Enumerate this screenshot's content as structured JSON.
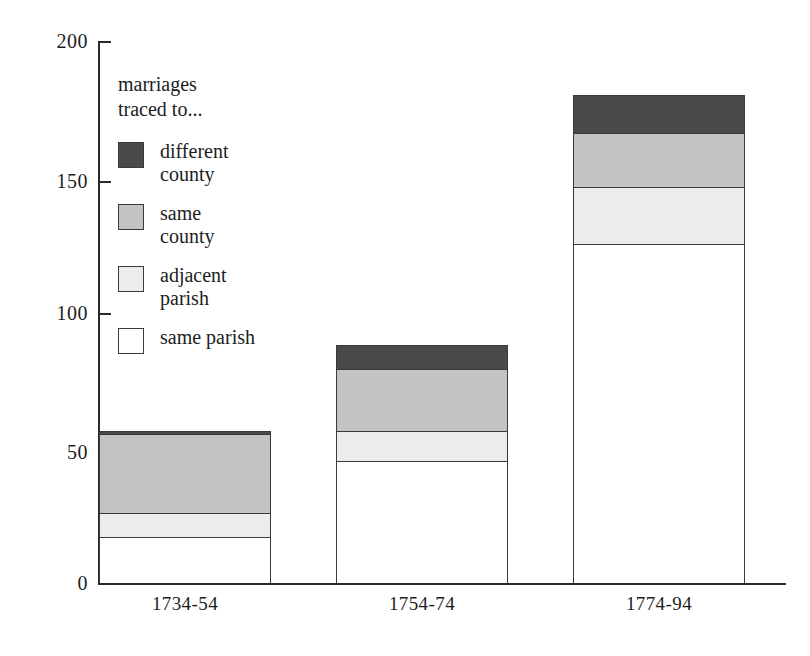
{
  "chart_data": {
    "type": "bar",
    "subtype": "stacked-bar",
    "title": "",
    "xlabel": "",
    "ylabel": "",
    "categories": [
      "1734-54",
      "1754-74",
      "1774-94"
    ],
    "series": [
      {
        "name": "same parish",
        "key": "same_parish",
        "color": "#ffffff",
        "values": [
          17,
          45,
          125
        ]
      },
      {
        "name": "adjacent parish",
        "key": "adjacent_parish",
        "color": "#ececec",
        "values": [
          9,
          11,
          21
        ]
      },
      {
        "name": "same county",
        "key": "same_county",
        "color": "#c3c3c3",
        "values": [
          29,
          23,
          20
        ]
      },
      {
        "name": "different county",
        "key": "different_county",
        "color": "#4a4a4a",
        "values": [
          1,
          9,
          14
        ]
      }
    ],
    "cumulative_tops": {
      "1734-54": {
        "same_parish": 17,
        "adjacent_parish": 26,
        "same_county": 55,
        "different_county": 56
      },
      "1754-74": {
        "same_parish": 45,
        "adjacent_parish": 56,
        "same_county": 79,
        "different_county": 88
      },
      "1774-94": {
        "same_parish": 125,
        "adjacent_parish": 146,
        "same_county": 166,
        "different_county": 180
      }
    },
    "totals": [
      56,
      88,
      180
    ],
    "ylim": [
      0,
      200
    ],
    "yticks": [
      0,
      50,
      100,
      150,
      200
    ],
    "ytick_labels": [
      "0",
      "50",
      "100",
      "150",
      "200"
    ],
    "grid": false,
    "legend_position": "inside-top-left"
  },
  "axis": {
    "y_labels": [
      "200",
      "150",
      "100",
      "50",
      "0"
    ],
    "x_labels": [
      "1734-54",
      "1754-74",
      "1774-94"
    ]
  },
  "legend": {
    "title": "marriages\ntraced to...",
    "items": [
      {
        "label": "different\ncounty",
        "color": "#4a4a4a",
        "swatch": "swatch-diff"
      },
      {
        "label": "same\ncounty",
        "color": "#c3c3c3",
        "swatch": "swatch-samec"
      },
      {
        "label": "adjacent\nparish",
        "color": "#ececec",
        "swatch": "swatch-adj"
      },
      {
        "label": "same parish",
        "color": "#ffffff",
        "swatch": "swatch-samep"
      }
    ]
  }
}
